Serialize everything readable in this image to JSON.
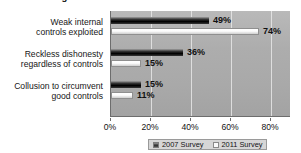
{
  "chart_data": {
    "type": "bar",
    "orientation": "horizontal",
    "title": "Percent citing these most common reasons to override controls",
    "xlabel": "",
    "ylabel": "",
    "xlim": [
      0,
      90
    ],
    "xticks": [
      "0%",
      "20%",
      "40%",
      "60%",
      "80%"
    ],
    "xtick_values": [
      0,
      20,
      40,
      60,
      80
    ],
    "grid": true,
    "grid_axis": "x",
    "legend_position": "bottom",
    "categories": [
      "Weak internal controls exploited",
      "Reckless dishonesty regardless of controls",
      "Collusion to circumvent good controls"
    ],
    "category_lines": [
      [
        "Weak internal",
        "controls exploited"
      ],
      [
        "Reckless dishonesty",
        "regardless of controls"
      ],
      [
        "Collusion to circumvent",
        "good controls"
      ]
    ],
    "series": [
      {
        "name": "2007 Survey",
        "color": "#1a1a1a",
        "values": [
          49,
          36,
          15
        ],
        "labels": [
          "49%",
          "36%",
          "15%"
        ]
      },
      {
        "name": "2011 Survey",
        "color": "#f7f7f7",
        "values": [
          74,
          15,
          11
        ],
        "labels": [
          "74%",
          "15%",
          "11%"
        ]
      }
    ]
  },
  "legend": {
    "items": [
      {
        "label": "2007 Survey",
        "swatch": "dark-swatch-icon"
      },
      {
        "label": "2011 Survey",
        "swatch": "light-swatch-icon"
      }
    ]
  }
}
